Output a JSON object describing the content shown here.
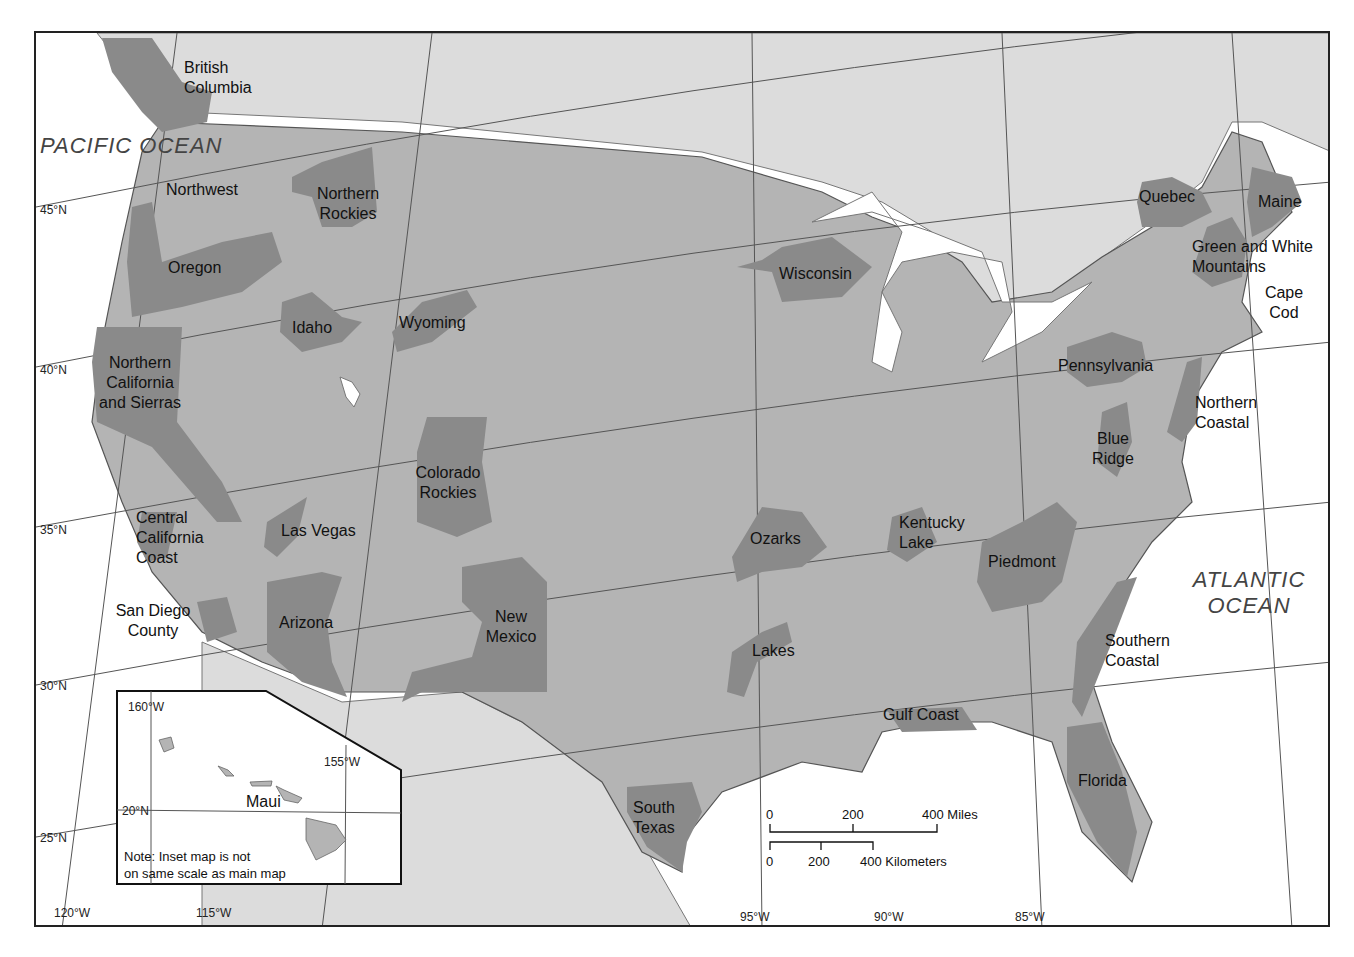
{
  "map": {
    "title": "Regions map of the contiguous United States",
    "colors": {
      "land_us": "#b4b4b4",
      "land_other": "#dcdcdc",
      "region": "#8a8a8a",
      "water": "#ffffff",
      "border": "#555555"
    },
    "oceans": {
      "pacific": "PACIFIC OCEAN",
      "atlantic": "ATLANTIC OCEAN"
    },
    "regions": [
      {
        "id": "british-columbia",
        "label": "British Columbia"
      },
      {
        "id": "northwest",
        "label": "Northwest"
      },
      {
        "id": "northern-rockies",
        "label": "Northern Rockies"
      },
      {
        "id": "oregon",
        "label": "Oregon"
      },
      {
        "id": "idaho",
        "label": "Idaho"
      },
      {
        "id": "wyoming",
        "label": "Wyoming"
      },
      {
        "id": "northern-california",
        "label": "Northern California and Sierras"
      },
      {
        "id": "colorado-rockies",
        "label": "Colorado Rockies"
      },
      {
        "id": "las-vegas",
        "label": "Las Vegas"
      },
      {
        "id": "central-california-coast",
        "label": "Central California Coast"
      },
      {
        "id": "san-diego-county",
        "label": "San Diego County"
      },
      {
        "id": "arizona",
        "label": "Arizona"
      },
      {
        "id": "new-mexico",
        "label": "New Mexico"
      },
      {
        "id": "south-texas",
        "label": "South Texas"
      },
      {
        "id": "ozarks",
        "label": "Ozarks"
      },
      {
        "id": "lakes",
        "label": "Lakes"
      },
      {
        "id": "wisconsin",
        "label": "Wisconsin"
      },
      {
        "id": "kentucky-lake",
        "label": "Kentucky Lake"
      },
      {
        "id": "gulf-coast",
        "label": "Gulf Coast"
      },
      {
        "id": "piedmont",
        "label": "Piedmont"
      },
      {
        "id": "pennsylvania",
        "label": "Pennsylvania"
      },
      {
        "id": "blue-ridge",
        "label": "Blue Ridge"
      },
      {
        "id": "northern-coastal",
        "label": "Northern Coastal"
      },
      {
        "id": "southern-coastal",
        "label": "Southern Coastal"
      },
      {
        "id": "florida",
        "label": "Florida"
      },
      {
        "id": "quebec",
        "label": "Quebec"
      },
      {
        "id": "maine",
        "label": "Maine"
      },
      {
        "id": "green-white-mountains",
        "label": "Green and White Mountains"
      },
      {
        "id": "cape-cod",
        "label": "Cape Cod"
      }
    ],
    "latitudes": [
      "45°N",
      "40°N",
      "35°N",
      "30°N",
      "25°N"
    ],
    "longitudes": [
      "120°W",
      "115°W",
      "95°W",
      "90°W",
      "85°W"
    ],
    "inset": {
      "label": "Maui",
      "lat": "20°N",
      "lon_left": "160°W",
      "lon_right": "155°W",
      "note_line1": "Note: Inset map is not",
      "note_line2": "on same scale as main map"
    },
    "scale": {
      "miles": [
        "0",
        "200",
        "400 Miles"
      ],
      "km": [
        "0",
        "200",
        "400 Kilometers"
      ]
    }
  }
}
